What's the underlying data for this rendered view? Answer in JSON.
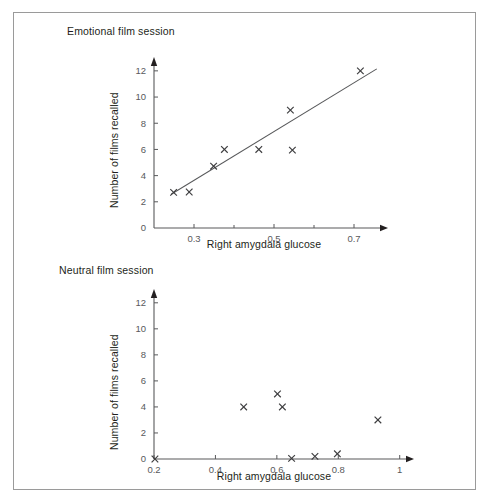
{
  "figure": {
    "border_color": "#9a9a9a",
    "background": "#ffffff"
  },
  "chart_data": [
    {
      "type": "scatter",
      "title": "Emotional film session",
      "xlabel": "Right amygdala glucose",
      "ylabel": "Number of films recalled",
      "xlim": [
        0.2,
        0.78
      ],
      "ylim": [
        0,
        12.6
      ],
      "xticks": [
        0.3,
        0.5,
        0.7
      ],
      "xticklabels": [
        "0.3",
        "0.5",
        "0.7"
      ],
      "xminorticks": [
        0.4,
        0.6
      ],
      "yticks": [
        0,
        2,
        4,
        6,
        8,
        10,
        12
      ],
      "yticklabels": [
        "0",
        "2",
        "4",
        "6",
        "8",
        "10",
        "12"
      ],
      "grid": false,
      "legend": "none",
      "marker": "x",
      "marker_color": "#3c3c3e",
      "points": [
        {
          "x": 0.249,
          "y": 2.72
        },
        {
          "x": 0.288,
          "y": 2.75
        },
        {
          "x": 0.349,
          "y": 4.72
        },
        {
          "x": 0.376,
          "y": 6.0
        },
        {
          "x": 0.462,
          "y": 6.0
        },
        {
          "x": 0.541,
          "y": 9.0
        },
        {
          "x": 0.546,
          "y": 5.95
        },
        {
          "x": 0.716,
          "y": 12.0
        }
      ],
      "trendline": {
        "x0": 0.243,
        "y0": 2.58,
        "x1": 0.757,
        "y1": 12.15,
        "color": "#58595b"
      }
    },
    {
      "type": "scatter",
      "title": "Neutral film session",
      "xlabel": "Right amygdala glucose",
      "ylabel": "Number of films recalled",
      "xlim": [
        0.2,
        1.04
      ],
      "ylim": [
        0,
        12.6
      ],
      "xticks": [
        0.2,
        0.4,
        0.6,
        0.8,
        1.0
      ],
      "xticklabels": [
        "0.2",
        "0.4",
        "0.6",
        "0.8",
        "1"
      ],
      "xminorticks": [],
      "yticks": [
        0,
        2,
        4,
        6,
        8,
        10,
        12
      ],
      "yticklabels": [
        "0",
        "2",
        "4",
        "6",
        "8",
        "10",
        "12"
      ],
      "grid": false,
      "legend": "none",
      "marker": "x",
      "marker_color": "#3c3c3e",
      "points": [
        {
          "x": 0.203,
          "y": 0.0
        },
        {
          "x": 0.492,
          "y": 4.0
        },
        {
          "x": 0.602,
          "y": 5.0
        },
        {
          "x": 0.618,
          "y": 4.0
        },
        {
          "x": 0.648,
          "y": 0.05
        },
        {
          "x": 0.724,
          "y": 0.2
        },
        {
          "x": 0.797,
          "y": 0.4
        },
        {
          "x": 0.929,
          "y": 3.0
        }
      ],
      "trendline": null
    }
  ]
}
